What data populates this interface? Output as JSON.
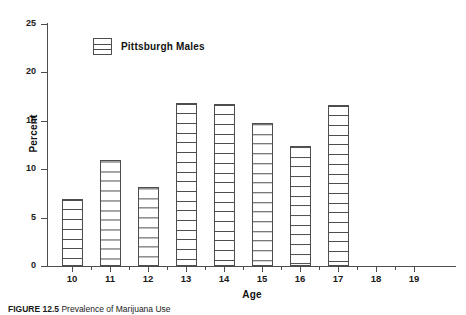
{
  "chart_data": {
    "type": "bar",
    "title": "",
    "xlabel": "Age",
    "ylabel": "Percent",
    "categories": [
      "10",
      "11",
      "12",
      "13",
      "14",
      "15",
      "16",
      "17",
      "18",
      "19"
    ],
    "values": [
      6.9,
      11.0,
      8.2,
      16.8,
      16.7,
      14.8,
      12.4,
      16.6,
      0,
      0
    ],
    "series": [
      {
        "name": "Pittsburgh Males",
        "values": [
          6.9,
          11.0,
          8.2,
          16.8,
          16.7,
          14.8,
          12.4,
          16.6,
          0,
          0
        ]
      }
    ],
    "ylim": [
      0,
      25
    ],
    "y_ticks": [
      0,
      5,
      10,
      15,
      20,
      25
    ],
    "y_tick_labels": [
      "0",
      "5",
      "10",
      "15",
      "20",
      "25"
    ],
    "x_tick_labels": [
      "10",
      "11",
      "12",
      "13",
      "14",
      "15",
      "16",
      "17",
      "18",
      "19"
    ],
    "grid": false,
    "legend": {
      "position": "upper-left-inside",
      "entries": [
        "Pittsburgh Males"
      ]
    },
    "bar_style": "white fill with horizontal stripe hatch, dark gray outline",
    "colors": {
      "bar_outline": "#4d4d4d",
      "bar_fill": "#ffffff",
      "hatch": "#4d4d4d",
      "axis": "#4d4d4d",
      "text": "#111111"
    }
  },
  "legend": {
    "label": "Pittsburgh Males",
    "swatch_name": "striped-box-swatch"
  },
  "axes": {
    "y_title": "Percent",
    "x_title": "Age"
  },
  "caption": {
    "figure_number": "FIGURE 12.5",
    "text": "Prevalence of Marijuana Use"
  }
}
